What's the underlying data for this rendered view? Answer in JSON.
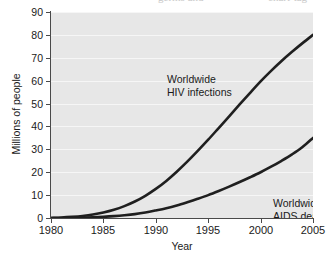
{
  "scan_artifact": {
    "fragment_left": "germs and",
    "fragment_right": "chart-tag"
  },
  "axes": {
    "y_title": "Millions of people",
    "x_title": "Year",
    "y_ticks": [
      "0",
      "10",
      "20",
      "30",
      "40",
      "50",
      "60",
      "70",
      "80",
      "90"
    ],
    "x_ticks": [
      "1980",
      "1985",
      "1990",
      "1995",
      "2000",
      "2005"
    ]
  },
  "annotations": {
    "hiv_line1": "Worldwide",
    "hiv_line2": "HIV infections",
    "aids_line1": "Worldwide",
    "aids_line2": "AIDS deaths"
  },
  "colors": {
    "panel_background": "#e7e7e7",
    "gridline": "#ffffff",
    "axis": "#4a4a4a",
    "curve": "#1f1f1f",
    "text": "#1a1a1a"
  },
  "chart_data": {
    "type": "line",
    "title": "",
    "xlabel": "Year",
    "ylabel": "Millions of people",
    "xlim": [
      1980,
      2005
    ],
    "ylim": [
      0,
      90
    ],
    "grid": true,
    "legend": "inline-annotations",
    "x": [
      1980,
      1981,
      1982,
      1983,
      1984,
      1985,
      1986,
      1987,
      1988,
      1989,
      1990,
      1991,
      1992,
      1993,
      1994,
      1995,
      1996,
      1997,
      1998,
      1999,
      2000,
      2001,
      2002,
      2003,
      2004,
      2005
    ],
    "series": [
      {
        "name": "Worldwide HIV infections",
        "values": [
          0,
          0.2,
          0.5,
          0.9,
          1.5,
          2.4,
          3.6,
          5.2,
          7.2,
          9.7,
          12.7,
          16.2,
          20.2,
          24.6,
          29.3,
          34.2,
          39.3,
          44.4,
          49.6,
          54.7,
          59.7,
          64.3,
          68.6,
          72.6,
          76.4,
          80.0
        ]
      },
      {
        "name": "Worldwide AIDS deaths",
        "values": [
          0,
          0.0,
          0.1,
          0.2,
          0.3,
          0.5,
          0.8,
          1.2,
          1.7,
          2.4,
          3.3,
          4.3,
          5.5,
          6.9,
          8.4,
          10.0,
          11.8,
          13.7,
          15.7,
          17.8,
          20.0,
          22.4,
          25.0,
          27.8,
          31.0,
          35.0
        ]
      }
    ]
  }
}
